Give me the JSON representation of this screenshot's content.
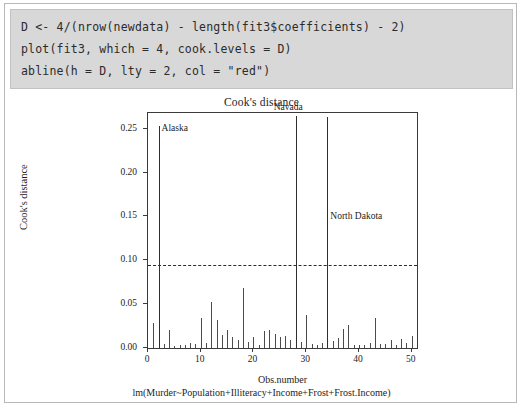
{
  "code_block": {
    "lines": [
      "D <- 4/(nrow(newdata) - length(fit3$coefficients) - 2)",
      "plot(fit3, which = 4, cook.levels = D)",
      "abline(h = D, lty = 2, col = \"red\")"
    ]
  },
  "chart_data": {
    "type": "bar",
    "title": "Cook's distance",
    "subtitle": "lm(Murder~Population+Illiteracy+Income+Frost+Frost.Income)",
    "xlabel": "Obs.number",
    "ylabel": "Cook's distance",
    "xlim": [
      0,
      51
    ],
    "ylim": [
      0,
      0.268
    ],
    "grid": false,
    "legend": null,
    "x_ticks": [
      "0",
      "10",
      "20",
      "30",
      "40",
      "50"
    ],
    "x_tick_values": [
      0,
      10,
      20,
      30,
      40,
      50
    ],
    "y_ticks": [
      "0.00",
      "0.05",
      "0.10",
      "0.15",
      "0.20",
      "0.25"
    ],
    "y_tick_values": [
      0.0,
      0.05,
      0.1,
      0.15,
      0.2,
      0.25
    ],
    "threshold": {
      "value": 0.0952,
      "style": "dashed",
      "color": "#2b2b2b",
      "label": "cook.levels = D"
    },
    "categories": [
      1,
      2,
      3,
      4,
      5,
      6,
      7,
      8,
      9,
      10,
      11,
      12,
      13,
      14,
      15,
      16,
      17,
      18,
      19,
      20,
      21,
      22,
      23,
      24,
      25,
      26,
      27,
      28,
      29,
      30,
      31,
      32,
      33,
      34,
      35,
      36,
      37,
      38,
      39,
      40,
      41,
      42,
      43,
      44,
      45,
      46,
      47,
      48,
      49,
      50
    ],
    "values": [
      0.028,
      0.253,
      0.005,
      0.021,
      0.002,
      0.004,
      0.004,
      0.006,
      0.005,
      0.034,
      0.006,
      0.052,
      0.032,
      0.015,
      0.021,
      0.012,
      0.009,
      0.068,
      0.007,
      0.012,
      0.004,
      0.019,
      0.021,
      0.016,
      0.013,
      0.014,
      0.009,
      0.265,
      0.007,
      0.038,
      0.005,
      0.003,
      0.006,
      0.264,
      0.008,
      0.011,
      0.022,
      0.026,
      0.004,
      0.003,
      0.003,
      0.006,
      0.034,
      0.005,
      0.005,
      0.009,
      0.004,
      0.01,
      0.006,
      0.014
    ],
    "annotations": [
      {
        "text": "Alaska",
        "obs": 2,
        "value": 0.253
      },
      {
        "text": "Navada",
        "obs": 28,
        "value": 0.265
      },
      {
        "text": "North Dakota",
        "obs": 34,
        "value": 0.264
      }
    ]
  }
}
